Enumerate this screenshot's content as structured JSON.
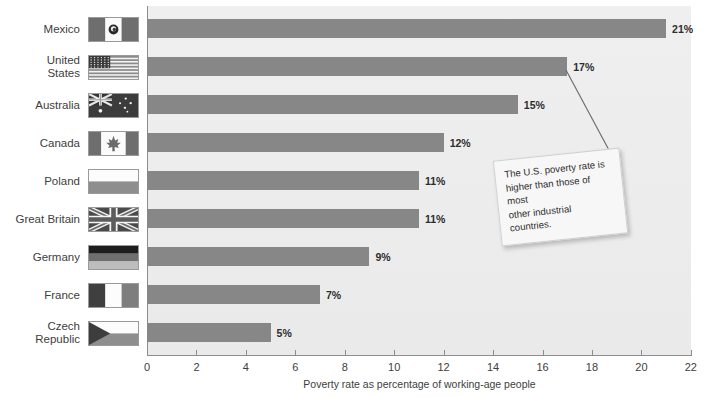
{
  "chart_data": {
    "type": "bar",
    "orientation": "horizontal",
    "title": "",
    "xlabel": "Poverty rate as percentage of working-age people",
    "ylabel": "",
    "xlim": [
      0,
      22
    ],
    "xticks": [
      0,
      2,
      4,
      6,
      8,
      10,
      12,
      14,
      16,
      18,
      20,
      22
    ],
    "grid": false,
    "legend": null,
    "categories": [
      "Mexico",
      "United States",
      "Australia",
      "Canada",
      "Poland",
      "Great Britain",
      "Germany",
      "France",
      "Czech Republic"
    ],
    "values": [
      21,
      17,
      15,
      12,
      11,
      11,
      9,
      7,
      5
    ],
    "value_labels": [
      "21%",
      "17%",
      "15%",
      "12%",
      "11%",
      "11%",
      "9%",
      "7%",
      "5%"
    ],
    "annotations": [
      {
        "text": "The U.S. poverty rate is higher than those of most other industrial countries.",
        "points_to": "United States"
      }
    ],
    "colors": {
      "bar": "#878787",
      "plot_background": "#ececec",
      "page_background": "#ffffff",
      "axis": "#8d8d8d",
      "text": "#3d3d3d"
    }
  },
  "rows": [
    {
      "label": "Mexico",
      "label_lines": [
        "Mexico"
      ],
      "value": 21,
      "value_label": "21%",
      "flag": "flag-mexico"
    },
    {
      "label": "United States",
      "label_lines": [
        "United",
        "States"
      ],
      "value": 17,
      "value_label": "17%",
      "flag": "flag-united-states"
    },
    {
      "label": "Australia",
      "label_lines": [
        "Australia"
      ],
      "value": 15,
      "value_label": "15%",
      "flag": "flag-australia"
    },
    {
      "label": "Canada",
      "label_lines": [
        "Canada"
      ],
      "value": 12,
      "value_label": "12%",
      "flag": "flag-canada"
    },
    {
      "label": "Poland",
      "label_lines": [
        "Poland"
      ],
      "value": 11,
      "value_label": "11%",
      "flag": "flag-poland"
    },
    {
      "label": "Great Britain",
      "label_lines": [
        "Great Britain"
      ],
      "value": 11,
      "value_label": "11%",
      "flag": "flag-great-britain"
    },
    {
      "label": "Germany",
      "label_lines": [
        "Germany"
      ],
      "value": 9,
      "value_label": "9%",
      "flag": "flag-germany"
    },
    {
      "label": "France",
      "label_lines": [
        "France"
      ],
      "value": 7,
      "value_label": "7%",
      "flag": "flag-france"
    },
    {
      "label": "Czech Republic",
      "label_lines": [
        "Czech Republic"
      ],
      "value": 5,
      "value_label": "5%",
      "flag": "flag-czech-republic"
    }
  ],
  "axis": {
    "title": "Poverty rate as percentage of working-age people",
    "ticks": [
      "0",
      "2",
      "4",
      "6",
      "8",
      "10",
      "12",
      "14",
      "16",
      "18",
      "20",
      "22"
    ]
  },
  "callout": {
    "line1": "The U.S. poverty rate is",
    "line2": "higher than those of most",
    "line3": "other industrial countries."
  }
}
